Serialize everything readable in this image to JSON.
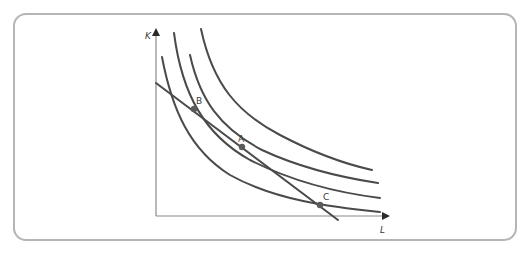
{
  "diagram": {
    "type": "isoquant-isocost",
    "axes": {
      "y_label": "K",
      "x_label": "L"
    },
    "points": [
      {
        "label": "A",
        "x": 242,
        "y": 147
      },
      {
        "label": "B",
        "x": 194,
        "y": 109
      },
      {
        "label": "C",
        "x": 320,
        "y": 205
      }
    ],
    "curves": [
      {
        "name": "isoquant-1"
      },
      {
        "name": "isoquant-2"
      },
      {
        "name": "isoquant-3"
      },
      {
        "name": "isoquant-4"
      }
    ],
    "line": {
      "name": "isocost-line"
    },
    "colors": {
      "curve": "#4a4a4a",
      "point": "#5a5a5a",
      "border": "#b5b5b5"
    }
  }
}
